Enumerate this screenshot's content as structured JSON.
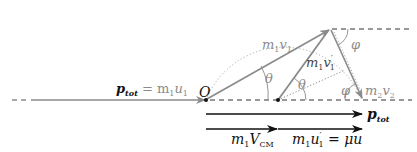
{
  "diagram": {
    "colors": {
      "arrow_grey": "#8a8a8a",
      "dark": "#111111",
      "dotted": "#aaaaaa",
      "background": "#ffffff"
    },
    "labels": {
      "origin": "O",
      "p_tot_left_p": "p",
      "p_tot_left_sub": "tot",
      "p_tot_left_eq": "= m",
      "p_tot_left_m_sub": "1",
      "p_tot_left_u": "u",
      "p_tot_left_u_sub": "1",
      "m1v1_m": "m",
      "m1v1_m_sub": "1",
      "m1v1_v": "v",
      "m1v1_v_sub": "1",
      "m1v1p_m": "m",
      "m1v1p_m_sub": "1",
      "m1v1p_v": "v",
      "m1v1p_v_sub": "1",
      "m1v1p_prime": "′",
      "m2v2_m": "m",
      "m2v2_m_sub": "2",
      "m2v2_v": "v",
      "m2v2_v_sub": "2",
      "theta_1": "θ",
      "theta_2": "θ",
      "phi_top": "φ",
      "phi_bottom": "φ",
      "p_tot_right_p": "p",
      "p_tot_right_sub": "tot",
      "m1Vcm_m": "m",
      "m1Vcm_m_sub": "1",
      "m1Vcm_V": "V",
      "m1Vcm_V_sub": "CM",
      "m1u1p_m": "m",
      "m1u1p_m_sub": "1",
      "m1u1p_u": "u",
      "m1u1p_prime": "′",
      "m1u1p_u_sub": "1",
      "m1u1p_eq": " = μu"
    },
    "points": {
      "O": [
        206,
        100
      ],
      "apex": [
        330,
        29
      ],
      "CM": [
        278,
        100
      ],
      "m2v2_tip": [
        363,
        99
      ]
    }
  }
}
